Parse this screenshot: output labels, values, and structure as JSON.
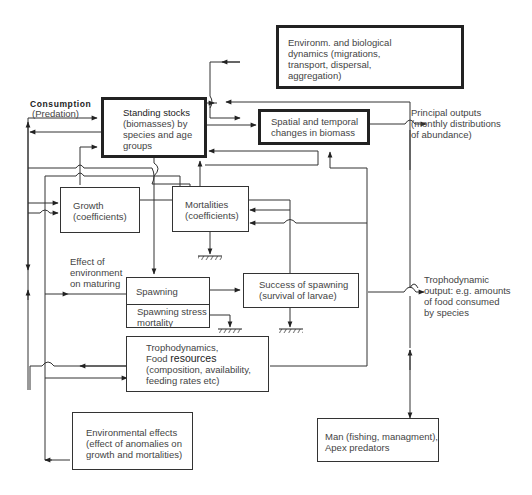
{
  "diagram": {
    "type": "flowchart",
    "boxes": {
      "standing_stocks": {
        "lines": [
          "Standing stocks",
          "(biomasses) by",
          "species and age",
          "groups"
        ]
      },
      "environ_dynamics": {
        "lines": [
          "Environm. and biological",
          "dynamics (migrations,",
          "transport, dispersal,",
          "aggregation)"
        ]
      },
      "spatial_temporal": {
        "lines": [
          "Spatial and temporal",
          "changes in biomass"
        ]
      },
      "growth": {
        "lines": [
          "Growth",
          "(coefficients)"
        ]
      },
      "mortalities": {
        "lines": [
          "Mortalities",
          "(coefficients)"
        ]
      },
      "spawning": {
        "label": "Spawning"
      },
      "spawning_stress": {
        "lines": [
          "Spawning stress",
          "mortality"
        ]
      },
      "success_spawning": {
        "lines": [
          "Success of spawning",
          "(survival of larvae)"
        ]
      },
      "trophodynamics": {
        "line1": "Trophodynamics,",
        "line2_prefix": "Food ",
        "line2_bold": "resources",
        "line3": "(composition, availability,",
        "line4": "feeding rates etc)"
      },
      "environmental_effects": {
        "lines": [
          "Environmental effects",
          "(effect of anomalies on",
          "growth and mortalities)"
        ]
      },
      "man_predators": {
        "lines": [
          "Man (fishing, managment),",
          "Apex predators"
        ]
      }
    },
    "labels": {
      "consumption": "Consumption",
      "predation": "(Predation)",
      "principal_outputs_line1": "Principal outputs",
      "principal_outputs_line2": "(monthly distributions",
      "principal_outputs_line3": "of abundance)",
      "effect_env_line1": "Effect of",
      "effect_env_line2": "environment",
      "effect_env_line3": "on maturing",
      "tropho_output_line1": "Trophodynamic",
      "tropho_output_line2": "output: e.g. amounts",
      "tropho_output_line3": "of food consumed",
      "tropho_output_line4": "by species"
    },
    "colors": {
      "line": "#333333",
      "text": "#444444",
      "background": "#ffffff"
    }
  }
}
